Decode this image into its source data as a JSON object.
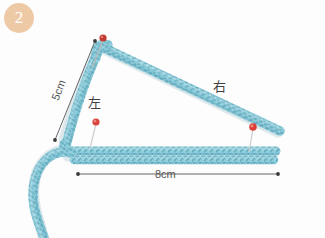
{
  "figure": {
    "step_number": "2",
    "background_color": "#fdfdfd",
    "cord_color": "#8ecddb",
    "cord_shadow_color": "#5fa8bc",
    "pin_color": "#d94040",
    "badge_color": "#eec9a6",
    "dimension_line_color": "#555555"
  },
  "labels": {
    "measure_vertical": "5cm",
    "measure_horizontal": "8cm",
    "side_left": "左",
    "side_right": "右"
  },
  "dimensions": [
    {
      "name": "vertical",
      "value": "5cm",
      "from": [
        95,
        41
      ],
      "to": [
        55,
        140
      ]
    },
    {
      "name": "horizontal",
      "value": "8cm",
      "from": [
        78,
        174
      ],
      "to": [
        278,
        174
      ]
    }
  ],
  "pins": [
    {
      "name": "apex-pin",
      "x": 103,
      "y": 38
    },
    {
      "name": "middle-pin",
      "x": 96,
      "y": 122
    },
    {
      "name": "right-pin",
      "x": 253,
      "y": 127
    }
  ]
}
